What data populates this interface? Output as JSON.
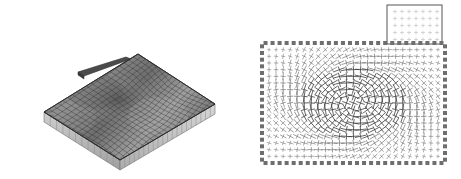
{
  "figure": {
    "title": "",
    "caption": "",
    "background_color": "#ffffff",
    "width": 461,
    "height": 179,
    "panel_count": 2
  },
  "panels": [
    {
      "id": "left",
      "name": "deformed-plate-3d-mesh",
      "type": "3d-surface-mesh",
      "description": "Shaded three-dimensional finite-element mesh of a deformed rectangular plate viewed in oblique projection, with a visible plate thickness band along the near edges and a thin flap protruding from the upper-left edge.",
      "axes_visible": false,
      "labels_visible": false,
      "colors": {
        "surface_dark": "#6b6b6b",
        "surface_mid": "#8d8d8d",
        "surface_light": "#b4b4b4",
        "mesh_line": "#3a3a3a",
        "edge_band": "#c9c9c9",
        "edge_band_line": "#7a7a7a",
        "flap": "#4a4a4a",
        "outline": "#2b2b2b"
      },
      "mesh": {
        "rows": 17,
        "cols": 21,
        "quad_elements": 320,
        "deformation": "central saddle / dimple with raised corners"
      },
      "projection": {
        "plate_corner_far_left_x": 44,
        "plate_corner_far_left_y": 112,
        "plate_corner_far_top_x": 138,
        "plate_corner_far_top_y": 54,
        "plate_corner_right_x": 215,
        "plate_corner_right_y": 104,
        "plate_corner_near_x": 120,
        "plate_corner_near_y": 160,
        "thickness_px": 10
      }
    },
    {
      "id": "right",
      "name": "principal-direction-cross-plot",
      "type": "vector-cross-field",
      "description": "Rectangular domain showing principal stress directions drawn as crossed tick pairs; the domain perimeter is ringed with solid square markers indicating constrained boundary nodes, and a small inset rectangle at the upper right shows a magnified low-magnitude region.",
      "axes_visible": false,
      "labels_visible": false,
      "colors": {
        "border_block": "#6e6e6e",
        "cross_stroke": "#5c5c5c",
        "cross_stroke_strong": "#3f3f3f",
        "inset_border": "#555555",
        "inset_tick": "#b9b9b9",
        "background": "#ffffff"
      },
      "domain": {
        "x": 32,
        "y": 43,
        "width": 183,
        "height": 120,
        "grid_cols": 26,
        "grid_rows": 18
      },
      "boundary": {
        "marker_shape": "filled-square",
        "marker_size_px": 4,
        "markers_top": 26,
        "markers_bottom": 26,
        "markers_left": 18,
        "markers_right": 18
      },
      "inset": {
        "x": 157,
        "y": 5,
        "width": 55,
        "height": 39,
        "grid_cols": 7,
        "grid_rows": 5,
        "marker_shape": "small-cross",
        "note": "magnified detail of near-uniform small crosses"
      }
    }
  ],
  "chart_data": {
    "type": "scatter",
    "title": "",
    "xlabel": "",
    "ylabel": "",
    "series": [
      {
        "name": "principal-direction-crosses",
        "marker": "cross",
        "count": 468,
        "description": "One crossed tick pair per interior grid node; arm length scales with principal magnitude and arm orientation with principal direction."
      },
      {
        "name": "boundary-nodes",
        "marker": "filled-square",
        "count": 88,
        "description": "Constrained perimeter nodes."
      }
    ],
    "legend_position": "none",
    "grid": false
  }
}
